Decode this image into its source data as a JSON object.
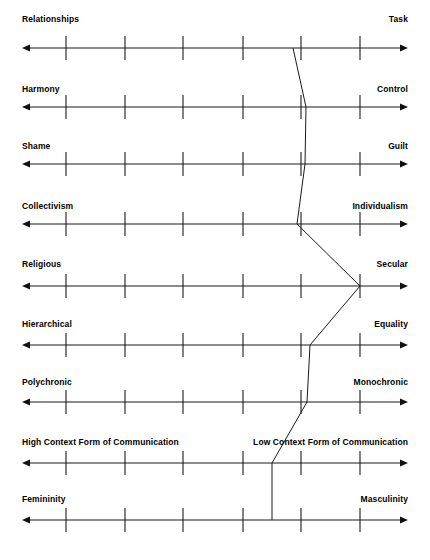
{
  "chart_data": {
    "type": "line",
    "title": "",
    "subtitle": "",
    "xlabel": "",
    "ylabel": "",
    "orientation": "horizontal-scales",
    "scale_min": 1,
    "scale_max": 7,
    "tick_count": 6,
    "grid": false,
    "legend": null,
    "axis_style": "double-headed-arrow",
    "line_color": "#1a1a1a",
    "axis_color": "#1a1a1a",
    "background_color": "#ffffff",
    "categories": [
      "Relationships - Task",
      "Harmony - Control",
      "Shame - Guilt",
      "Collectivism - Individualism",
      "Religious - Secular",
      "Hierarchical - Equality",
      "Polychronic - Monochronic",
      "High Context Form of Communication - Low Context Form of Communication",
      "Femininity - Masculinity"
    ],
    "series": [
      {
        "name": "Cultural profile",
        "values": [
          4.8,
          5.0,
          5.0,
          4.9,
          6.0,
          5.1,
          5.1,
          4.3,
          4.3
        ]
      }
    ],
    "rows": [
      {
        "index": 0,
        "left_label": "Relationships",
        "right_label": "Task",
        "value": 4.8,
        "marker_x_px": 293,
        "axis_y_px": 48,
        "label_y_px": 14
      },
      {
        "index": 1,
        "left_label": "Harmony",
        "right_label": "Control",
        "value": 5.0,
        "marker_x_px": 306,
        "axis_y_px": 107,
        "label_y_px": 84
      },
      {
        "index": 2,
        "left_label": "Shame",
        "right_label": "Guilt",
        "value": 5.0,
        "marker_x_px": 305,
        "axis_y_px": 164,
        "label_y_px": 141
      },
      {
        "index": 3,
        "left_label": "Collectivism",
        "right_label": "Individualism",
        "value": 4.9,
        "marker_x_px": 297,
        "axis_y_px": 224,
        "label_y_px": 201
      },
      {
        "index": 4,
        "left_label": "Religious",
        "right_label": "Secular",
        "value": 6.0,
        "marker_x_px": 360,
        "axis_y_px": 286,
        "label_y_px": 259
      },
      {
        "index": 5,
        "left_label": "Hierarchical",
        "right_label": "Equality",
        "value": 5.1,
        "marker_x_px": 310,
        "axis_y_px": 345,
        "label_y_px": 319
      },
      {
        "index": 6,
        "left_label": "Polychronic",
        "right_label": "Monochronic",
        "value": 5.1,
        "marker_x_px": 307,
        "axis_y_px": 402,
        "label_y_px": 377
      },
      {
        "index": 7,
        "left_label": "High Context Form of Communication",
        "right_label": "Low Context Form of Communication",
        "value": 4.3,
        "marker_x_px": 272,
        "axis_y_px": 463,
        "label_y_px": 437
      },
      {
        "index": 8,
        "left_label": "Femininity",
        "right_label": "Masculinity",
        "value": 4.3,
        "marker_x_px": 272,
        "axis_y_px": 520,
        "label_y_px": 494
      }
    ],
    "tick_positions_px": [
      66,
      125,
      183,
      243,
      301,
      360
    ],
    "axis_start_px": 22,
    "axis_end_px": 408
  }
}
